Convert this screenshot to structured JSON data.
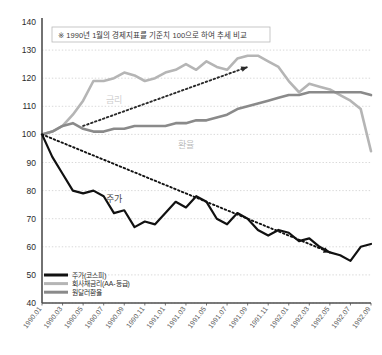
{
  "chart_data": {
    "type": "line",
    "title": "",
    "note": "※ 1990년 1월의 경제지표를 기준치 100으로 하여 추세 비교",
    "xlabel": "",
    "ylabel": "",
    "ylim": [
      40,
      140
    ],
    "ytick_values": [
      140,
      130,
      120,
      110,
      100,
      90,
      80,
      70,
      60,
      50,
      40
    ],
    "grid": true,
    "grid_style": "dotted",
    "legend_position": "bottom-left",
    "x": [
      "1990.01",
      "1990.02",
      "1990.03",
      "1990.04",
      "1990.05",
      "1990.06",
      "1990.07",
      "1990.08",
      "1990.09",
      "1990.10",
      "1990.11",
      "1990.12",
      "1991.01",
      "1991.02",
      "1991.03",
      "1991.04",
      "1991.05",
      "1991.06",
      "1991.07",
      "1991.08",
      "1991.09",
      "1991.10",
      "1991.11",
      "1991.12",
      "1992.01",
      "1992.02",
      "1992.03",
      "1992.04",
      "1992.05",
      "1992.06",
      "1992.07",
      "1992.08",
      "1992.09"
    ],
    "xtick_labels": [
      "1990.01",
      "1990.03",
      "1990.05",
      "1990.07",
      "1990.09",
      "1990.11",
      "1991.01",
      "1991.03",
      "1991.05",
      "1991.07",
      "1991.09",
      "1991.11",
      "1992.01",
      "1992.03",
      "1992.05",
      "1992.07",
      "1992.09"
    ],
    "series": [
      {
        "name": "주가(코스피)",
        "color": "#111111",
        "width": 2.2,
        "style": "solid",
        "values": [
          100,
          92,
          86,
          80,
          79,
          80,
          78,
          72,
          73,
          67,
          69,
          68,
          72,
          76,
          74,
          78,
          76,
          70,
          68,
          72,
          70,
          66,
          64,
          66,
          65,
          62,
          63,
          60,
          58,
          57,
          55,
          60,
          61
        ]
      },
      {
        "name": "회사채금리(AA-등급)",
        "color": "#b5b5b5",
        "width": 2.6,
        "style": "solid",
        "values": [
          100,
          101,
          103,
          107,
          112,
          119,
          119,
          120,
          122,
          121,
          119,
          120,
          122,
          123,
          125,
          123,
          126,
          124,
          123,
          127,
          128,
          128,
          126,
          124,
          119,
          115,
          118,
          117,
          116,
          114,
          112,
          109,
          94
        ]
      },
      {
        "name": "원달러환율",
        "color": "#8a8a8a",
        "width": 2.6,
        "style": "solid",
        "values": [
          100,
          101,
          103,
          104,
          102,
          101,
          101,
          102,
          102,
          103,
          103,
          103,
          103,
          104,
          104,
          105,
          105,
          106,
          107,
          109,
          110,
          111,
          112,
          113,
          114,
          114,
          115,
          115,
          115,
          115,
          115,
          115,
          114
        ]
      }
    ],
    "annotations": [
      {
        "name": "rate-inline-label",
        "text": "금리",
        "x_index": 7,
        "y_value": 111,
        "color": "#cfcfcf"
      },
      {
        "name": "fx-inline-label",
        "text": "환율",
        "x_index": 14,
        "y_value": 95,
        "color": "#bdbdbd"
      },
      {
        "name": "stock-inline-label",
        "text": "주가",
        "x_index": 7,
        "y_value": 76,
        "color": "#4a4a4a"
      }
    ],
    "trend_arrows": [
      {
        "name": "rate-trend-arrow",
        "direction": "up",
        "from": {
          "x_index": 4,
          "y_value": 103
        },
        "to": {
          "x_index": 20,
          "y_value": 124
        },
        "style": "dotted",
        "color": "#2a2a2a"
      },
      {
        "name": "stock-trend-arrow",
        "direction": "down",
        "from": {
          "x_index": 0,
          "y_value": 100
        },
        "to": {
          "x_index": 28,
          "y_value": 58
        },
        "style": "dotted",
        "color": "#111111"
      }
    ]
  },
  "legend": {
    "items": [
      {
        "label": "주가(코스피)",
        "color": "#111111"
      },
      {
        "label": "회사채금리(AA-등급)",
        "color": "#b5b5b5"
      },
      {
        "label": "원달러환율",
        "color": "#8a8a8a"
      }
    ]
  },
  "axis": {
    "y_values": [
      "140",
      "130",
      "120",
      "110",
      "100",
      "90",
      "80",
      "70",
      "60",
      "50",
      "40"
    ],
    "x_values": [
      "1990.01",
      "1990.03",
      "1990.05",
      "1990.07",
      "1990.09",
      "1990.11",
      "1991.01",
      "1991.03",
      "1991.05",
      "1991.07",
      "1991.09",
      "1991.11",
      "1992.01",
      "1992.03",
      "1992.05",
      "1992.07",
      "1992.09"
    ]
  },
  "colors": {
    "axis": "#4f4f4f",
    "grid": "#c8c8c8",
    "background": "#ffffff",
    "text": "#2b2b2b"
  }
}
